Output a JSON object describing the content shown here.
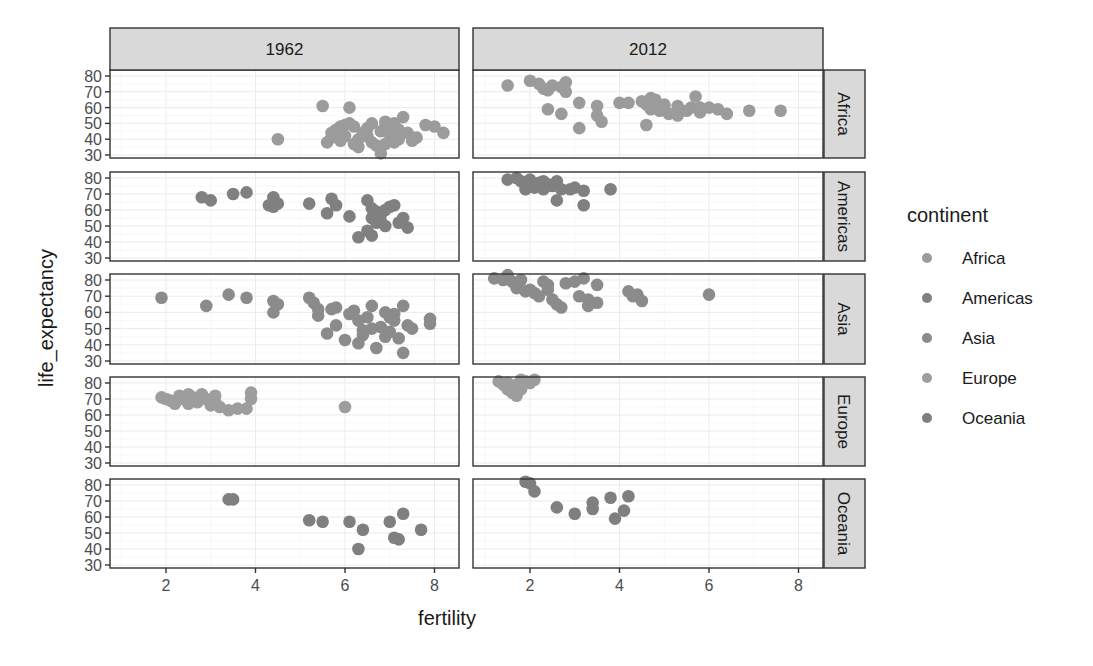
{
  "chart_data": {
    "type": "scatter",
    "title": "",
    "xlabel": "fertility",
    "ylabel": "life_expectancy",
    "facet_columns": [
      "1962",
      "2012"
    ],
    "facet_rows": [
      "Africa",
      "Americas",
      "Asia",
      "Europe",
      "Oceania"
    ],
    "x_ticks": [
      2,
      4,
      6,
      8
    ],
    "y_ticks": [
      30,
      40,
      50,
      60,
      70,
      80
    ],
    "xlim": [
      0.8,
      8.6
    ],
    "ylim": [
      27,
      84
    ],
    "grid": true,
    "legend": {
      "title": "continent",
      "position": "right",
      "entries": [
        {
          "label": "Africa",
          "color": "#9b9b9b"
        },
        {
          "label": "Americas",
          "color": "#808080"
        },
        {
          "label": "Asia",
          "color": "#8b8b8b"
        },
        {
          "label": "Europe",
          "color": "#9d9d9d"
        },
        {
          "label": "Oceania",
          "color": "#7f7f7f"
        }
      ]
    },
    "panels": [
      {
        "year": "1962",
        "continent": "Africa",
        "points": [
          [
            4.5,
            40
          ],
          [
            5.5,
            61
          ],
          [
            6.1,
            60
          ],
          [
            5.6,
            38
          ],
          [
            5.7,
            44
          ],
          [
            5.8,
            46
          ],
          [
            5.9,
            48
          ],
          [
            6.0,
            49
          ],
          [
            6.1,
            50
          ],
          [
            6.2,
            48
          ],
          [
            6.0,
            42
          ],
          [
            5.9,
            39
          ],
          [
            6.2,
            37
          ],
          [
            6.3,
            40
          ],
          [
            6.4,
            44
          ],
          [
            6.5,
            42
          ],
          [
            6.6,
            38
          ],
          [
            6.7,
            36
          ],
          [
            6.8,
            45
          ],
          [
            6.9,
            48
          ],
          [
            6.9,
            51
          ],
          [
            7.0,
            47
          ],
          [
            7.0,
            43
          ],
          [
            7.1,
            50
          ],
          [
            7.2,
            46
          ],
          [
            7.2,
            40
          ],
          [
            7.3,
            54
          ],
          [
            7.4,
            44
          ],
          [
            7.5,
            39
          ],
          [
            7.6,
            41
          ],
          [
            7.8,
            49
          ],
          [
            8.0,
            48
          ],
          [
            8.2,
            44
          ],
          [
            6.8,
            31
          ],
          [
            6.5,
            47
          ],
          [
            6.6,
            50
          ],
          [
            7.1,
            38
          ],
          [
            6.3,
            35
          ],
          [
            5.7,
            41
          ],
          [
            6.9,
            37
          ]
        ]
      },
      {
        "year": "1962",
        "continent": "Americas",
        "points": [
          [
            2.8,
            68
          ],
          [
            3.0,
            66
          ],
          [
            3.5,
            70
          ],
          [
            3.8,
            71
          ],
          [
            4.3,
            63
          ],
          [
            4.4,
            68
          ],
          [
            4.5,
            64
          ],
          [
            4.4,
            62
          ],
          [
            5.2,
            64
          ],
          [
            5.6,
            58
          ],
          [
            5.7,
            67
          ],
          [
            5.8,
            63
          ],
          [
            6.1,
            56
          ],
          [
            6.3,
            43
          ],
          [
            6.5,
            47
          ],
          [
            6.6,
            44
          ],
          [
            6.5,
            66
          ],
          [
            6.6,
            61
          ],
          [
            6.7,
            59
          ],
          [
            6.8,
            57
          ],
          [
            6.9,
            60
          ],
          [
            6.8,
            53
          ],
          [
            6.9,
            50
          ],
          [
            7.0,
            62
          ],
          [
            7.1,
            63
          ],
          [
            7.2,
            52
          ],
          [
            7.3,
            55
          ],
          [
            7.4,
            49
          ],
          [
            6.6,
            55
          ],
          [
            6.7,
            52
          ]
        ]
      },
      {
        "year": "1962",
        "continent": "Asia",
        "points": [
          [
            1.9,
            69
          ],
          [
            2.9,
            64
          ],
          [
            3.4,
            71
          ],
          [
            3.8,
            69
          ],
          [
            4.4,
            67
          ],
          [
            4.5,
            65
          ],
          [
            4.4,
            60
          ],
          [
            5.2,
            69
          ],
          [
            5.3,
            66
          ],
          [
            5.4,
            62
          ],
          [
            5.4,
            58
          ],
          [
            5.7,
            62
          ],
          [
            5.8,
            63
          ],
          [
            5.8,
            52
          ],
          [
            5.6,
            47
          ],
          [
            6.0,
            43
          ],
          [
            6.1,
            59
          ],
          [
            6.3,
            55
          ],
          [
            6.3,
            41
          ],
          [
            6.4,
            49
          ],
          [
            6.5,
            57
          ],
          [
            6.6,
            64
          ],
          [
            6.6,
            50
          ],
          [
            6.7,
            38
          ],
          [
            6.8,
            51
          ],
          [
            6.9,
            60
          ],
          [
            7.0,
            48
          ],
          [
            7.0,
            57
          ],
          [
            7.1,
            55
          ],
          [
            7.2,
            44
          ],
          [
            7.3,
            64
          ],
          [
            7.3,
            35
          ],
          [
            7.4,
            52
          ],
          [
            7.5,
            50
          ],
          [
            7.9,
            56
          ],
          [
            7.9,
            53
          ],
          [
            6.2,
            61
          ],
          [
            6.9,
            45
          ],
          [
            7.1,
            59
          ],
          [
            6.4,
            46
          ]
        ]
      },
      {
        "year": "1962",
        "continent": "Europe",
        "points": [
          [
            1.9,
            71
          ],
          [
            2.0,
            70
          ],
          [
            2.1,
            69
          ],
          [
            2.3,
            72
          ],
          [
            2.4,
            70
          ],
          [
            2.5,
            67
          ],
          [
            2.6,
            71
          ],
          [
            2.7,
            68
          ],
          [
            2.8,
            73
          ],
          [
            2.9,
            70
          ],
          [
            3.1,
            72
          ],
          [
            3.1,
            68
          ],
          [
            3.2,
            65
          ],
          [
            3.4,
            63
          ],
          [
            3.6,
            64
          ],
          [
            3.8,
            64
          ],
          [
            3.9,
            70
          ],
          [
            3.9,
            74
          ],
          [
            6.0,
            65
          ],
          [
            2.2,
            67
          ],
          [
            2.5,
            73
          ],
          [
            3.0,
            66
          ]
        ]
      },
      {
        "year": "1962",
        "continent": "Oceania",
        "points": [
          [
            3.4,
            71
          ],
          [
            3.5,
            71
          ],
          [
            5.2,
            58
          ],
          [
            5.5,
            57
          ],
          [
            6.1,
            57
          ],
          [
            6.3,
            40
          ],
          [
            6.4,
            52
          ],
          [
            7.0,
            57
          ],
          [
            7.1,
            47
          ],
          [
            7.2,
            46
          ],
          [
            7.3,
            62
          ],
          [
            7.7,
            52
          ]
        ]
      },
      {
        "year": "2012",
        "continent": "Africa",
        "points": [
          [
            1.5,
            74
          ],
          [
            2.0,
            77
          ],
          [
            2.2,
            75
          ],
          [
            2.3,
            72
          ],
          [
            2.4,
            71
          ],
          [
            2.5,
            74
          ],
          [
            2.7,
            73
          ],
          [
            2.8,
            76
          ],
          [
            2.8,
            70
          ],
          [
            2.4,
            59
          ],
          [
            2.7,
            56
          ],
          [
            3.1,
            63
          ],
          [
            3.5,
            61
          ],
          [
            3.1,
            47
          ],
          [
            3.5,
            55
          ],
          [
            3.6,
            51
          ],
          [
            4.0,
            63
          ],
          [
            4.2,
            63
          ],
          [
            4.5,
            64
          ],
          [
            4.6,
            62
          ],
          [
            4.7,
            66
          ],
          [
            4.8,
            65
          ],
          [
            4.7,
            59
          ],
          [
            4.9,
            58
          ],
          [
            5.0,
            61
          ],
          [
            5.1,
            56
          ],
          [
            5.0,
            62
          ],
          [
            5.3,
            55
          ],
          [
            5.3,
            61
          ],
          [
            5.6,
            60
          ],
          [
            5.7,
            67
          ],
          [
            5.8,
            60
          ],
          [
            5.8,
            57
          ],
          [
            6.0,
            60
          ],
          [
            6.2,
            59
          ],
          [
            6.4,
            56
          ],
          [
            4.6,
            49
          ],
          [
            6.9,
            58
          ],
          [
            7.6,
            58
          ],
          [
            5.5,
            58
          ]
        ]
      },
      {
        "year": "2012",
        "continent": "Americas",
        "points": [
          [
            1.5,
            79
          ],
          [
            1.7,
            80
          ],
          [
            1.8,
            78
          ],
          [
            1.9,
            77
          ],
          [
            2.0,
            76
          ],
          [
            2.0,
            79
          ],
          [
            2.1,
            74
          ],
          [
            2.2,
            77
          ],
          [
            2.2,
            75
          ],
          [
            2.3,
            78
          ],
          [
            2.4,
            76
          ],
          [
            2.5,
            75
          ],
          [
            2.6,
            78
          ],
          [
            2.7,
            73
          ],
          [
            2.6,
            66
          ],
          [
            2.9,
            73
          ],
          [
            3.0,
            74
          ],
          [
            3.2,
            72
          ],
          [
            3.2,
            63
          ],
          [
            3.8,
            73
          ],
          [
            1.9,
            73
          ],
          [
            2.3,
            73
          ]
        ]
      },
      {
        "year": "2012",
        "continent": "Asia",
        "points": [
          [
            1.2,
            81
          ],
          [
            1.4,
            80
          ],
          [
            1.5,
            83
          ],
          [
            1.6,
            79
          ],
          [
            1.7,
            75
          ],
          [
            1.8,
            80
          ],
          [
            1.9,
            73
          ],
          [
            2.1,
            72
          ],
          [
            2.2,
            70
          ],
          [
            2.3,
            79
          ],
          [
            2.4,
            77
          ],
          [
            2.5,
            68
          ],
          [
            2.6,
            65
          ],
          [
            2.7,
            63
          ],
          [
            2.8,
            78
          ],
          [
            3.0,
            79
          ],
          [
            3.2,
            81
          ],
          [
            3.1,
            70
          ],
          [
            3.3,
            68
          ],
          [
            3.5,
            66
          ],
          [
            3.5,
            77
          ],
          [
            4.2,
            73
          ],
          [
            4.4,
            71
          ],
          [
            4.5,
            67
          ],
          [
            4.3,
            70
          ],
          [
            6.0,
            71
          ],
          [
            2.0,
            74
          ],
          [
            2.4,
            74
          ],
          [
            3.3,
            64
          ]
        ]
      },
      {
        "year": "2012",
        "continent": "Europe",
        "points": [
          [
            1.3,
            81
          ],
          [
            1.4,
            79
          ],
          [
            1.5,
            80
          ],
          [
            1.6,
            77
          ],
          [
            1.6,
            74
          ],
          [
            1.7,
            72
          ],
          [
            1.8,
            82
          ],
          [
            1.9,
            81
          ],
          [
            2.0,
            80
          ],
          [
            2.1,
            82
          ],
          [
            1.5,
            76
          ],
          [
            1.7,
            79
          ],
          [
            1.8,
            76
          ]
        ]
      },
      {
        "year": "2012",
        "continent": "Oceania",
        "points": [
          [
            1.9,
            82
          ],
          [
            2.0,
            81
          ],
          [
            2.1,
            76
          ],
          [
            2.6,
            66
          ],
          [
            3.0,
            62
          ],
          [
            3.4,
            69
          ],
          [
            3.4,
            65
          ],
          [
            3.8,
            72
          ],
          [
            3.9,
            59
          ],
          [
            4.1,
            64
          ],
          [
            4.2,
            73
          ]
        ]
      }
    ]
  },
  "legend_title": "continent",
  "x_axis_title": "fertility",
  "y_axis_title": "life_expectancy",
  "strips": {
    "col1": "1962",
    "col2": "2012"
  },
  "row_strips": [
    "Africa",
    "Americas",
    "Asia",
    "Europe",
    "Oceania"
  ]
}
